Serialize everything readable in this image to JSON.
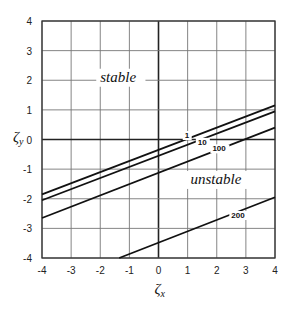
{
  "chart_data": {
    "type": "line",
    "title": "",
    "xlabel": "ζx",
    "ylabel": "ζy",
    "xlim": [
      -4,
      4
    ],
    "ylim": [
      -4,
      4
    ],
    "grid": true,
    "x_ticks": [
      "-4",
      "-3",
      "-2",
      "-1",
      "0",
      "1",
      "2",
      "3",
      "4"
    ],
    "y_ticks": [
      "4",
      "3",
      "2",
      "1",
      "0",
      "-1",
      "-2",
      "-3",
      "-4"
    ],
    "annotations": [
      {
        "text": "stable",
        "x": -2,
        "y": 1.95
      },
      {
        "text": "unstable",
        "x": 1.1,
        "y": -1.5
      }
    ],
    "series": [
      {
        "name": "1",
        "x": [
          -4,
          4
        ],
        "y": [
          -1.85,
          1.15
        ],
        "label_pos": [
          0.9,
          0.05
        ]
      },
      {
        "name": "10",
        "x": [
          -4,
          4
        ],
        "y": [
          -2.05,
          0.95
        ],
        "label_pos": [
          1.35,
          -0.18
        ]
      },
      {
        "name": "100",
        "x": [
          -4,
          4
        ],
        "y": [
          -2.65,
          0.4
        ],
        "label_pos": [
          1.85,
          -0.4
        ]
      },
      {
        "name": "200",
        "x": [
          -1.35,
          4
        ],
        "y": [
          -4,
          -1.95
        ],
        "label_pos": [
          2.5,
          -2.65
        ]
      }
    ]
  }
}
